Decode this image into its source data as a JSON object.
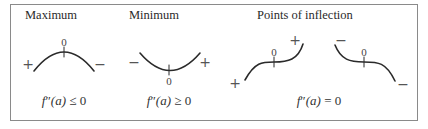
{
  "panels": [
    {
      "title": "Maximum",
      "zero_label": "0",
      "left_sign": "+",
      "right_sign": "−",
      "formula": {
        "func": "f",
        "prime": "″",
        "arg": "(a)",
        "relation": "≤",
        "value": "0"
      }
    },
    {
      "title": "Minimum",
      "zero_label": "0",
      "left_sign": "−",
      "right_sign": "+",
      "formula": {
        "func": "f",
        "prime": "″",
        "arg": "(a)",
        "relation": "≥",
        "value": "0"
      }
    },
    {
      "title": "Points of inflection",
      "curves": [
        {
          "zero_label": "0",
          "left_sign": "+",
          "right_sign": "+"
        },
        {
          "zero_label": "0",
          "left_sign": "−",
          "right_sign": "−"
        }
      ],
      "formula": {
        "func": "f",
        "prime": "″",
        "arg": "(a)",
        "relation": "=",
        "value": "0"
      }
    }
  ],
  "colors": {
    "stroke": "#2a2a2a",
    "border": "#8a8a8a",
    "sign": "#555555"
  }
}
